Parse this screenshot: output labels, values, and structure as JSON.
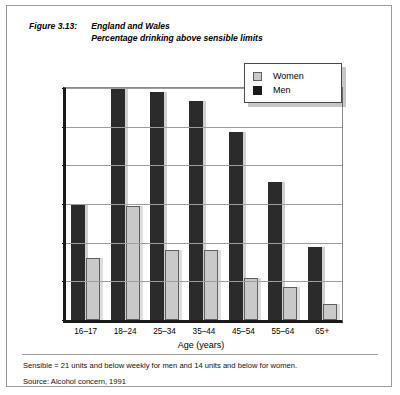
{
  "figure": {
    "label": "Figure 3.13:",
    "title_line1": "England and Wales",
    "title_line2": "Percentage drinking above sensible limits"
  },
  "legend": {
    "position": "top-right",
    "items": [
      {
        "label": "Women",
        "color": "#c9c9c9",
        "icon": "legend-swatch-women"
      },
      {
        "label": "Men",
        "color": "#1c1c1c",
        "icon": "legend-swatch-men"
      }
    ]
  },
  "footer": {
    "note": "Sensible = 21 units and below weekly for men and 14 units and below for women.",
    "source": "Source: Alcohol concern, 1991"
  },
  "chart_data": {
    "type": "bar",
    "xlabel": "Age (years)",
    "ylabel": "",
    "categories": [
      "16–17",
      "18–24",
      "25–34",
      "35–44",
      "45–54",
      "55–64",
      "65+"
    ],
    "series": [
      {
        "name": "Men",
        "color": "#2b2b2b",
        "values": [
          15.0,
          30.0,
          29.5,
          28.3,
          24.3,
          17.8,
          9.4
        ]
      },
      {
        "name": "Women",
        "color": "#c9c9c9",
        "values": [
          8.0,
          14.7,
          9.0,
          9.0,
          5.4,
          4.3,
          2.1
        ]
      }
    ],
    "series_draw_order": [
      "Men",
      "Women"
    ],
    "ylim": [
      0,
      30
    ],
    "yticks": [
      0,
      5,
      10,
      15,
      20,
      25,
      30
    ],
    "ytick_labels": [
      "0%",
      "5%",
      "10%",
      "15%",
      "20%",
      "25%",
      "30%"
    ],
    "grid": true,
    "grid_axis": "y",
    "legend_position": "upper right"
  }
}
